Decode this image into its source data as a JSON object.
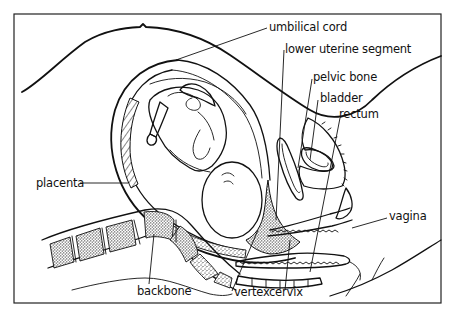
{
  "figure": {
    "labels": {
      "umbilical_cord": "umbilical cord",
      "lower_uterine_segment": "lower uterine segment",
      "pelvic_bone": "pelvic bone",
      "bladder": "bladder",
      "rectum": "rectum",
      "placenta": "placenta",
      "vagina": "vagina",
      "backbone": "backbone",
      "vertex": "vertex",
      "cervix": "cervix"
    },
    "colors": {
      "ink": "#111111",
      "background": "#ffffff"
    }
  }
}
